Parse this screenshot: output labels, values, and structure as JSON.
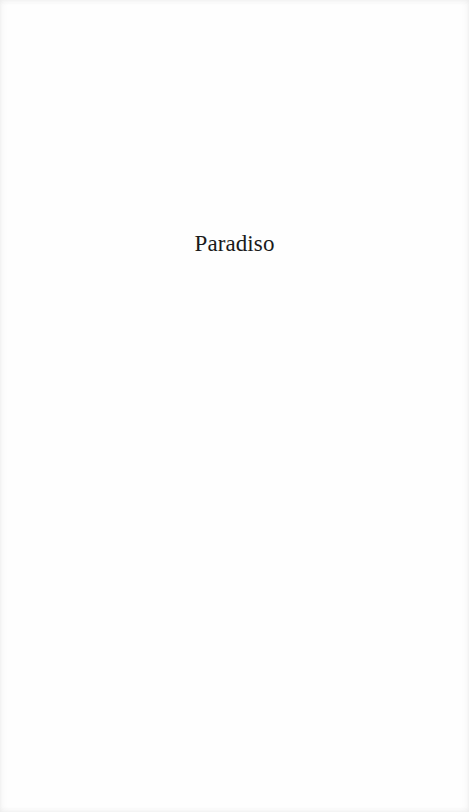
{
  "page": {
    "half_title": "Paradiso"
  }
}
